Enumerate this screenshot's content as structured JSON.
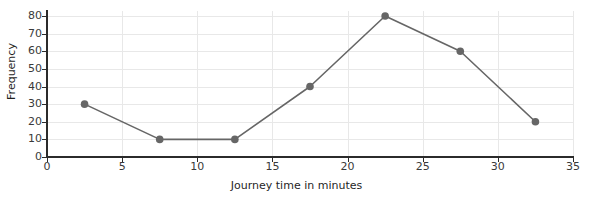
{
  "chart_data": {
    "type": "line",
    "title": "",
    "xlabel": "Journey time in minutes",
    "ylabel": "Frequency",
    "xlim": [
      0,
      35
    ],
    "ylim": [
      0,
      80
    ],
    "xticks": [
      0,
      5,
      10,
      15,
      20,
      25,
      30,
      35
    ],
    "yticks": [
      0,
      10,
      20,
      30,
      40,
      50,
      60,
      70,
      80
    ],
    "grid": true,
    "legend": null,
    "series": [
      {
        "name": "Frequency polygon",
        "marker": "circle",
        "color": "#666666",
        "x": [
          2.5,
          7.5,
          12.5,
          17.5,
          22.5,
          27.5,
          32.5
        ],
        "values": [
          30,
          10,
          10,
          40,
          80,
          60,
          20
        ]
      }
    ]
  },
  "axes": {
    "y_title": "Frequency",
    "x_title": "Journey time in minutes",
    "y_tick_labels": [
      "80",
      "70",
      "60",
      "50",
      "40",
      "30",
      "20",
      "10",
      "0"
    ],
    "x_tick_labels": [
      "0",
      "5",
      "10",
      "15",
      "20",
      "25",
      "30",
      "35"
    ]
  },
  "style": {
    "axis_color": "#2b2b2b",
    "grid_color": "#e8e8e8",
    "series_color": "#666666",
    "background": "#ffffff",
    "text_color": "#3a3a3a"
  }
}
